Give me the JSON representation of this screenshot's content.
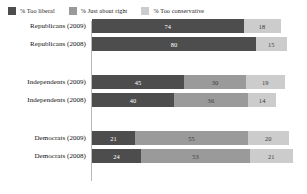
{
  "chart_data": {
    "type": "bar",
    "orientation": "horizontal",
    "stacked": true,
    "title": "",
    "subtitle": "",
    "xlabel": "",
    "ylabel": "",
    "xlim": [
      0,
      100
    ],
    "grid": false,
    "legend_position": "top-left",
    "categories": [
      "Republicans (2009)",
      "Republicans (2008)",
      "Independents (2009)",
      "Independents (2008)",
      "Democrats (2009)",
      "Democrats (2008)"
    ],
    "series": [
      {
        "name": "% Too liberal",
        "color": "#4d4d4d",
        "values": [
          74,
          80,
          45,
          40,
          21,
          24
        ]
      },
      {
        "name": "% Just about right",
        "color": "#9a9a9a",
        "values": [
          0,
          0,
          30,
          36,
          55,
          53
        ]
      },
      {
        "name": "% Too conservative",
        "color": "#cccccc",
        "values": [
          18,
          15,
          19,
          14,
          20,
          21
        ]
      }
    ]
  },
  "legend": {
    "items": [
      {
        "label": "% Too liberal",
        "color": "#4d4d4d",
        "swatch_name": "legend-swatch-too-liberal"
      },
      {
        "label": "% Just about right",
        "color": "#9a9a9a",
        "swatch_name": "legend-swatch-just-about-right"
      },
      {
        "label": "% Too conservative",
        "color": "#cccccc",
        "swatch_name": "legend-swatch-too-conservative"
      }
    ]
  },
  "rows": [
    {
      "label": "Republicans (2009)",
      "segments": [
        {
          "series": "% Too liberal",
          "value": 74,
          "display": "74"
        },
        {
          "series": "% Just about right",
          "value": 0,
          "display": ""
        },
        {
          "series": "% Too conservative",
          "value": 18,
          "display": "18"
        }
      ]
    },
    {
      "label": "Republicans (2008)",
      "segments": [
        {
          "series": "% Too liberal",
          "value": 80,
          "display": "80"
        },
        {
          "series": "% Just about right",
          "value": 0,
          "display": ""
        },
        {
          "series": "% Too conservative",
          "value": 15,
          "display": "15"
        }
      ]
    },
    {
      "label": "Independents (2009)",
      "segments": [
        {
          "series": "% Too liberal",
          "value": 45,
          "display": "45"
        },
        {
          "series": "% Just about right",
          "value": 30,
          "display": "30"
        },
        {
          "series": "% Too conservative",
          "value": 19,
          "display": "19"
        }
      ]
    },
    {
      "label": "Independents (2008)",
      "segments": [
        {
          "series": "% Too liberal",
          "value": 40,
          "display": "40"
        },
        {
          "series": "% Just about right",
          "value": 36,
          "display": "36"
        },
        {
          "series": "% Too conservative",
          "value": 14,
          "display": "14"
        }
      ]
    },
    {
      "label": "Democrats (2009)",
      "segments": [
        {
          "series": "% Too liberal",
          "value": 21,
          "display": "21"
        },
        {
          "series": "% Just about right",
          "value": 55,
          "display": "55"
        },
        {
          "series": "% Too conservative",
          "value": 20,
          "display": "20"
        }
      ]
    },
    {
      "label": "Democrats (2008)",
      "segments": [
        {
          "series": "% Too liberal",
          "value": 24,
          "display": "24"
        },
        {
          "series": "% Just about right",
          "value": 53,
          "display": "53"
        },
        {
          "series": "% Too conservative",
          "value": 21,
          "display": "21"
        }
      ]
    }
  ],
  "layout": {
    "group_tops": [
      0,
      56,
      112
    ],
    "scale_max": 100
  }
}
